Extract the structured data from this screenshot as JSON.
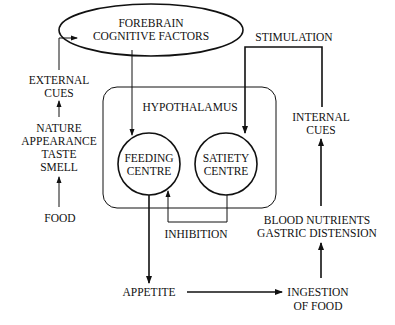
{
  "diagram": {
    "colors": {
      "ink": "#111111",
      "background": "#ffffff"
    },
    "nodes": {
      "forebrain": {
        "line1": "FOREBRAIN",
        "line2": "COGNITIVE FACTORS",
        "shape": "ellipse"
      },
      "external_cues": {
        "line1": "EXTERNAL",
        "line2": "CUES"
      },
      "food_properties": {
        "line1": "NATURE",
        "line2": "APPEARANCE",
        "line3": "TASTE",
        "line4": "SMELL"
      },
      "food": {
        "label": "FOOD"
      },
      "hypothalamus": {
        "label": "HYPOTHALAMUS",
        "shape": "rounded-rectangle"
      },
      "feeding_centre": {
        "line1": "FEEDING",
        "line2": "CENTRE",
        "shape": "circle"
      },
      "satiety_centre": {
        "line1": "SATIETY",
        "line2": "CENTRE",
        "shape": "circle"
      },
      "stimulation": {
        "label": "STIMULATION"
      },
      "internal_cues": {
        "line1": "INTERNAL",
        "line2": "CUES"
      },
      "blood_nutrients": {
        "line1": "BLOOD NUTRIENTS",
        "line2": "GASTRIC DISTENSION"
      },
      "inhibition": {
        "label": "INHIBITION"
      },
      "appetite": {
        "label": "APPETITE"
      },
      "ingestion": {
        "line1": "INGESTION",
        "line2": "OF FOOD"
      }
    },
    "edges": [
      {
        "from": "food",
        "to": "food_properties"
      },
      {
        "from": "food_properties",
        "to": "external_cues"
      },
      {
        "from": "external_cues",
        "to": "forebrain"
      },
      {
        "from": "forebrain",
        "to": "feeding_centre"
      },
      {
        "from": "internal_cues",
        "to": "satiety_centre",
        "label": "STIMULATION"
      },
      {
        "from": "satiety_centre",
        "to": "feeding_centre",
        "label": "INHIBITION"
      },
      {
        "from": "feeding_centre",
        "to": "appetite"
      },
      {
        "from": "appetite",
        "to": "ingestion"
      },
      {
        "from": "ingestion",
        "to": "blood_nutrients"
      },
      {
        "from": "blood_nutrients",
        "to": "internal_cues"
      }
    ]
  }
}
